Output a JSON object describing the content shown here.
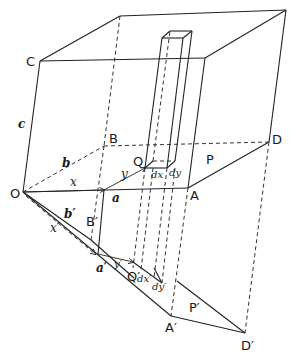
{
  "figure": {
    "labels": {
      "C": "C",
      "c": "c",
      "B": "B",
      "b": "b",
      "O": "O",
      "x": "x",
      "a": "a",
      "A": "A",
      "D": "D",
      "P": "P",
      "Q": "Q",
      "y": "y",
      "dx": "dx",
      "dy": "dy",
      "b_prime": "b′",
      "B_prime": "B′",
      "x_prime": "x′",
      "a_prime": "a′",
      "y_prime": "y′",
      "Q_prime": "Q′",
      "dx_prime": "dx′",
      "dy_prime": "dy′",
      "A_prime": "A′",
      "P_prime": "P′",
      "D_prime": "D′"
    },
    "colors": {
      "line": "#222222",
      "background": "#ffffff"
    }
  }
}
